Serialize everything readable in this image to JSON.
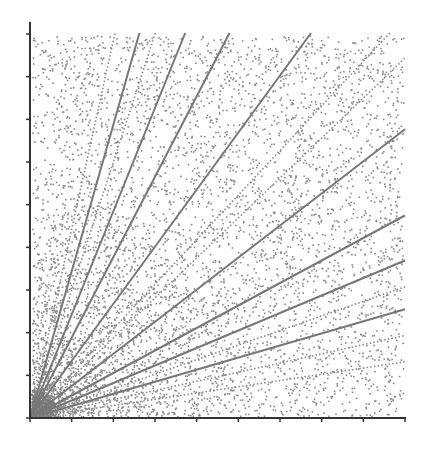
{
  "chart_data": {
    "type": "scatter",
    "title": "",
    "xlabel": "",
    "ylabel": "",
    "xlim": [
      0,
      9
    ],
    "ylim": [
      0,
      9.5
    ],
    "grid": false,
    "legend": null,
    "x_ticks": [
      0,
      1,
      2,
      3,
      4,
      5,
      6,
      7,
      8,
      9
    ],
    "y_ticks": [
      0,
      1,
      2,
      3,
      4,
      5,
      6,
      7,
      8,
      9
    ],
    "tick_labels_visible": false,
    "point_color": "#8a8a8a",
    "point_count_estimate": 6000,
    "rays": [
      {
        "style": "dotted",
        "slope": 4.53,
        "end": "top"
      },
      {
        "style": "solid",
        "slope": 3.52,
        "end": "top"
      },
      {
        "style": "dotted",
        "slope": 3.07,
        "end": "top"
      },
      {
        "style": "solid",
        "slope": 2.48,
        "end": "top"
      },
      {
        "style": "solid",
        "slope": 1.93,
        "end": "top"
      },
      {
        "style": "solid",
        "slope": 1.37,
        "end": "top"
      },
      {
        "style": "dotted",
        "slope": 1.07,
        "end": "top"
      },
      {
        "style": "dotted",
        "slope": 0.96,
        "end": "right"
      },
      {
        "style": "solid",
        "slope": 0.77,
        "end": "right"
      },
      {
        "style": "solid",
        "slope": 0.54,
        "end": "right"
      },
      {
        "style": "solid",
        "slope": 0.42,
        "end": "right"
      },
      {
        "style": "dotted",
        "slope": 0.35,
        "end": "right"
      },
      {
        "style": "solid",
        "slope": 0.29,
        "end": "right"
      },
      {
        "style": "dotted",
        "slope": 0.22,
        "end": "right"
      },
      {
        "style": "dotted",
        "slope": 0.15,
        "end": "right"
      }
    ]
  },
  "colors": {
    "axis": "#333333",
    "point": "#8a8a8a",
    "solid_ray": "#777777",
    "dotted_ray": "#888888",
    "background": "#ffffff"
  }
}
